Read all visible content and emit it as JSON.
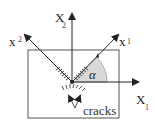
{
  "diagram": {
    "type": "coordinate-rotation-diagram",
    "axes": {
      "x1": {
        "label": "X",
        "subscript": "1"
      },
      "x2": {
        "label": "X",
        "subscript": "2"
      },
      "x1_prime": {
        "label": "x",
        "subscript": "1",
        "prime": "'"
      },
      "x2_prime": {
        "label": "x",
        "subscript": "2",
        "prime": "'"
      }
    },
    "angle_label": "α",
    "annotation": "cracks",
    "colors": {
      "lines": "#222222",
      "angle_fill": "#d9d9d9",
      "box": "#555555"
    }
  }
}
